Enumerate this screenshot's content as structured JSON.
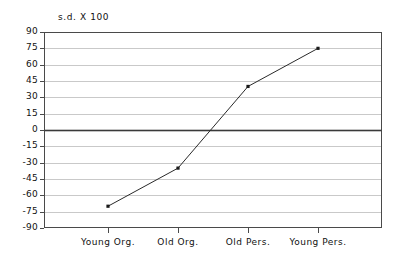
{
  "chart_data": {
    "type": "line",
    "title": "",
    "axis_note": "s.d. X 100",
    "xlabel": "",
    "ylabel": "s.d. X 100",
    "categories": [
      "Young Org.",
      "Old Org.",
      "Old Pers.",
      "Young Pers."
    ],
    "values": [
      -70,
      -35,
      40,
      75
    ],
    "series": [
      {
        "name": "s.d. X 100",
        "values": [
          -70,
          -35,
          40,
          75
        ]
      }
    ],
    "ylim": [
      -90,
      90
    ],
    "yticks": [
      90,
      75,
      60,
      45,
      30,
      15,
      0,
      -15,
      -30,
      -45,
      -60,
      -75,
      -90
    ],
    "ytick_labels": [
      "90",
      "75",
      "60",
      "45",
      "30",
      "15",
      "0",
      "-15",
      "-30",
      "-45",
      "-60",
      "-75",
      "-90"
    ],
    "grid": true,
    "grid_axis": "y",
    "zero_line": true,
    "legend": null,
    "legend_position": "none",
    "marker": "square",
    "line_color": "#2a2a2a",
    "grid_color": "#c9c9c9",
    "zero_line_color": "#3a3a3a",
    "frame_color": "#4a4a4a",
    "background": "#ffffff"
  }
}
